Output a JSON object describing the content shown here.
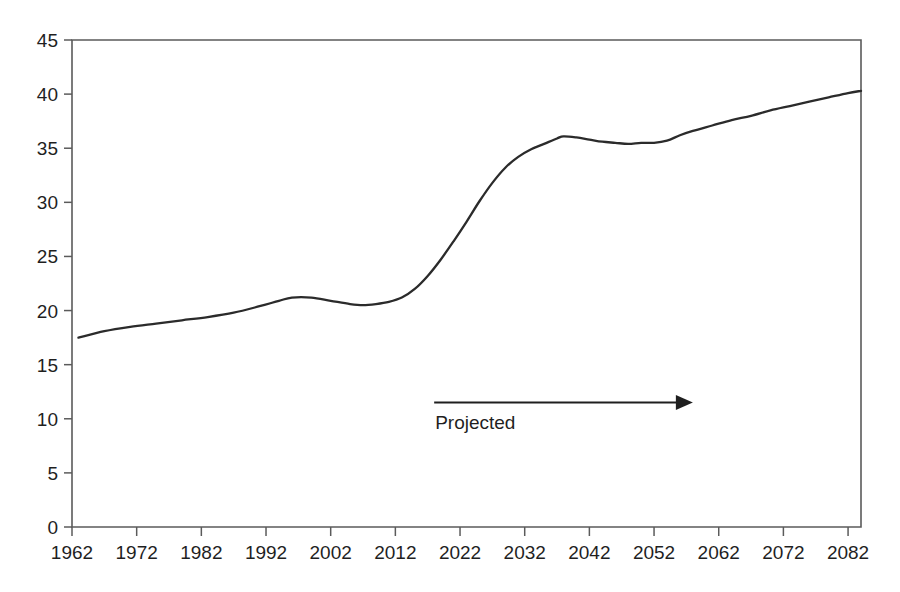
{
  "chart_data": {
    "type": "line",
    "title": "",
    "subtitle": "",
    "xlabel": "",
    "ylabel": "",
    "xlim": [
      1962,
      2084
    ],
    "ylim": [
      0,
      45
    ],
    "grid": false,
    "legend": null,
    "y_ticks": [
      0,
      5,
      10,
      15,
      20,
      25,
      30,
      35,
      40,
      45
    ],
    "y_tick_labels": [
      "0",
      "5",
      "10",
      "15",
      "20",
      "25",
      "30",
      "35",
      "40",
      "45"
    ],
    "x_ticks": [
      1962,
      1972,
      1982,
      1992,
      2002,
      2012,
      2022,
      2032,
      2042,
      2052,
      2062,
      2072,
      2082
    ],
    "x_tick_labels": [
      "1962",
      "1972",
      "1982",
      "1992",
      "2002",
      "2012",
      "2022",
      "2032",
      "2042",
      "2052",
      "2062",
      "2072",
      "2082"
    ],
    "series": [
      {
        "name": "series-1",
        "x": [
          1963,
          1967,
          1971,
          1975,
          1979,
          1983,
          1987,
          1991,
          1994,
          1996,
          1999,
          2002,
          2005,
          2007,
          2009,
          2011,
          2013,
          2015,
          2017,
          2019,
          2021,
          2023,
          2025,
          2027,
          2029,
          2031,
          2033,
          2035,
          2037,
          2038,
          2040,
          2042,
          2044,
          2046,
          2048,
          2050,
          2052,
          2054,
          2056,
          2058,
          2061,
          2064,
          2067,
          2070,
          2073,
          2076,
          2079,
          2082,
          2084
        ],
        "values": [
          17.5,
          18.1,
          18.5,
          18.8,
          19.1,
          19.4,
          19.8,
          20.4,
          20.9,
          21.2,
          21.2,
          20.9,
          20.6,
          20.5,
          20.6,
          20.8,
          21.2,
          22.0,
          23.2,
          24.7,
          26.4,
          28.2,
          30.1,
          31.8,
          33.2,
          34.2,
          34.9,
          35.4,
          35.9,
          36.1,
          36.0,
          35.8,
          35.6,
          35.5,
          35.4,
          35.5,
          35.5,
          35.7,
          36.2,
          36.6,
          37.1,
          37.6,
          38.0,
          38.5,
          38.9,
          39.3,
          39.7,
          40.1,
          40.3
        ]
      }
    ],
    "annotations": [
      {
        "name": "projected-annotation",
        "label": "Projected",
        "arrow_from_year": 2018,
        "arrow_to_year": 2058,
        "arrow_value": 11.5,
        "label_value": 9.1
      }
    ],
    "colors": {
      "series_line": "#2b2b2b",
      "axis": "#5b5b5b",
      "text": "#1f1f1f",
      "background": "#ffffff"
    }
  }
}
